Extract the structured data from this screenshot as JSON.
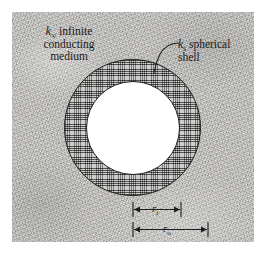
{
  "figure": {
    "background_color": "#b9b7b4",
    "line_color": "#1d1d1d",
    "cavity_color": "#ffffff"
  },
  "annotations": {
    "medium": {
      "symbol": "k",
      "subscript": "∞",
      "text_line1": "infinite",
      "text_line2": "conducting",
      "text_line3": "medium"
    },
    "shell": {
      "symbol": "k",
      "subscript": "s",
      "text_line1": "spherical",
      "text_line2": "shell"
    }
  },
  "dimensions": [
    {
      "name": "inner-radius",
      "symbol": "r",
      "subscript": "i"
    },
    {
      "name": "outer-radius",
      "symbol": "r",
      "subscript": "o"
    }
  ],
  "geometry": {
    "center_x": 132.5,
    "center_y": 127.5,
    "outer_radius": 68,
    "inner_radius": 47
  }
}
